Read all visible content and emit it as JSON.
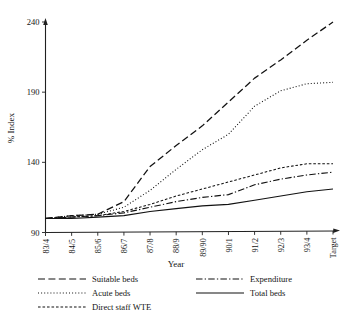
{
  "chart_data": {
    "type": "line",
    "title": "",
    "xlabel": "Year",
    "ylabel": "% Index",
    "categories": [
      "83/4",
      "84/5",
      "85/6",
      "86/7",
      "87/8",
      "88/9",
      "89/90",
      "90/1",
      "91/2",
      "92/3",
      "93/4",
      "Target"
    ],
    "ylim": [
      90,
      240
    ],
    "yticks": [
      90,
      140,
      190,
      240
    ],
    "grid": false,
    "legend_position": "below-plot",
    "series": [
      {
        "name": "Suitable beds",
        "style": "dashed",
        "color": "#111111",
        "values": [
          100,
          102,
          103,
          112,
          137,
          152,
          166,
          183,
          200,
          213,
          227,
          240
        ]
      },
      {
        "name": "Acute beds",
        "style": "dotted",
        "color": "#111111",
        "values": [
          100,
          102,
          103,
          108,
          120,
          135,
          149,
          160,
          180,
          191,
          196,
          197
        ]
      },
      {
        "name": "Direct staff WTE",
        "style": "fine-dashed",
        "color": "#111111",
        "values": [
          100,
          101,
          102,
          105,
          110,
          116,
          121,
          126,
          131,
          136,
          139,
          139
        ]
      },
      {
        "name": "Expenditure",
        "style": "dash-dot",
        "color": "#111111",
        "values": [
          100,
          101,
          102,
          104,
          108,
          112,
          115,
          117,
          124,
          128,
          131,
          133
        ]
      },
      {
        "name": "Total beds",
        "style": "solid",
        "color": "#111111",
        "values": [
          100,
          100,
          101,
          102,
          105,
          107,
          109,
          110,
          113,
          116,
          119,
          121
        ]
      }
    ]
  },
  "axes": {
    "y_label": "% Index",
    "x_label": "Year",
    "y_tick_labels": [
      "90",
      "140",
      "190",
      "240"
    ],
    "x_tick_labels": [
      "83/4",
      "84/5",
      "85/6",
      "86/7",
      "87/8",
      "88/9",
      "89/90",
      "90/1",
      "91/2",
      "92/3",
      "93/4",
      "Target"
    ]
  },
  "legend": {
    "column_left": [
      {
        "label": "Suitable beds",
        "style": "dashed"
      },
      {
        "label": "Acute beds",
        "style": "dotted"
      },
      {
        "label": "Direct staff WTE",
        "style": "fine-dashed"
      }
    ],
    "column_right": [
      {
        "label": "Expenditure",
        "style": "dash-dot"
      },
      {
        "label": "Total beds",
        "style": "solid"
      }
    ]
  }
}
